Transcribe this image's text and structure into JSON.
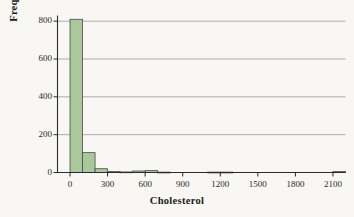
{
  "chart_data": {
    "type": "bar",
    "title": "",
    "subtitle": "",
    "xlabel": "Cholesterol",
    "ylabel": "Frequency",
    "xlim": [
      -100,
      2200
    ],
    "ylim": [
      0,
      830
    ],
    "grid": "horizontal",
    "legend": "none",
    "bin_width": 100,
    "xticks": [
      0,
      300,
      600,
      900,
      1200,
      1500,
      1800,
      2100
    ],
    "xtick_labels": [
      "0",
      "300",
      "600",
      "900",
      "1200",
      "1500",
      "1800",
      "2100"
    ],
    "yticks": [
      0,
      200,
      400,
      600,
      800
    ],
    "ytick_labels": [
      "0",
      "200",
      "400",
      "600",
      "800"
    ],
    "bar_fill": "#a9c99b",
    "bar_stroke": "#4a4a4a",
    "bin_starts": [
      0,
      100,
      200,
      300,
      400,
      500,
      600,
      700,
      800,
      900,
      1000,
      1100,
      1200,
      1300,
      1400,
      1500,
      1600,
      1700,
      1800,
      1900,
      2000,
      2100
    ],
    "categories": [
      "0-100",
      "100-200",
      "200-300",
      "300-400",
      "400-500",
      "500-600",
      "600-700",
      "700-800",
      "800-900",
      "900-1000",
      "1000-1100",
      "1100-1200",
      "1200-1300",
      "1300-1400",
      "1400-1500",
      "1500-1600",
      "1600-1700",
      "1700-1800",
      "1800-1900",
      "1900-2000",
      "2000-2100",
      "2100-2200"
    ],
    "values": [
      810,
      105,
      20,
      5,
      3,
      8,
      10,
      2,
      0,
      0,
      0,
      2,
      2,
      0,
      0,
      0,
      0,
      0,
      0,
      0,
      0,
      5
    ]
  },
  "axis": {
    "y_label": "Frequency",
    "x_label": "Cholesterol"
  }
}
